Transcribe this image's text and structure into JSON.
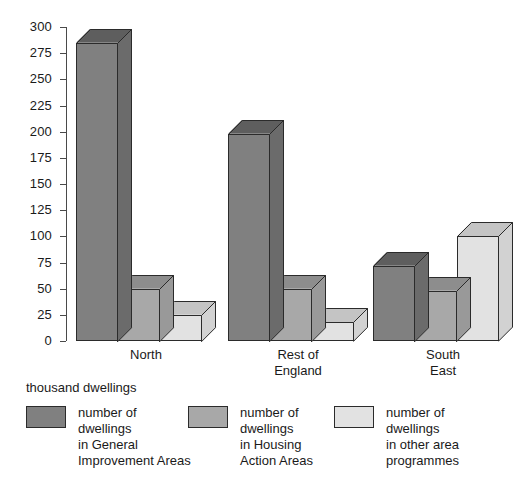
{
  "chart_data": {
    "type": "bar",
    "title": "",
    "subtitle": "",
    "xlabel": "",
    "ylabel": "thousand dwellings",
    "ylim": [
      0,
      300
    ],
    "ytick_step": 25,
    "grid": false,
    "legend_position": "bottom",
    "style": "3d-bars-grayscale",
    "categories": [
      "North",
      "Rest of\nEngland",
      "South\nEast"
    ],
    "yticks": [
      "0",
      "25",
      "50",
      "75",
      "100",
      "125",
      "150",
      "175",
      "200",
      "225",
      "250",
      "275",
      "300"
    ],
    "series": [
      {
        "name": "number of\ndwellings\nin General\nImprovement Areas",
        "color": "#808080",
        "values": [
          285,
          198,
          72
        ]
      },
      {
        "name": "number of\ndwellings\nin Housing\nAction Areas",
        "color": "#a8a8a8",
        "values": [
          50,
          50,
          48
        ]
      },
      {
        "name": "number of\ndwellings\nin other area\nprogrammes",
        "color": "#e2e2e2",
        "values": [
          25,
          18,
          100
        ]
      }
    ]
  },
  "axis": {
    "units_label": "thousand dwellings"
  },
  "colors": {
    "series_1_face": "#808080",
    "series_1_top": "#5e5e5e",
    "series_1_side": "#6b6b6b",
    "series_2_face": "#a8a8a8",
    "series_2_top": "#8d8d8d",
    "series_2_side": "#999999",
    "series_3_face": "#e2e2e2",
    "series_3_top": "#c4c4c4",
    "series_3_side": "#d2d2d2",
    "axis": "#4a4a4a",
    "outline": "#2b2b2b",
    "background": "#ffffff",
    "text": "#1a1a1a"
  }
}
